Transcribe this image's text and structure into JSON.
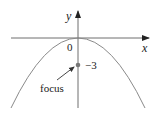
{
  "diagram": {
    "type": "parabola",
    "equation_implied": "x^2 = -12y",
    "axes": {
      "x_label": "x",
      "y_label": "y",
      "origin_label": "0"
    },
    "focus": {
      "label": "focus",
      "value_label": "−3",
      "y": -3
    },
    "colors": {
      "axis": "#6f6f6f",
      "curve": "#8a8a8a",
      "text": "#222222",
      "focus_point": "#777777"
    }
  }
}
